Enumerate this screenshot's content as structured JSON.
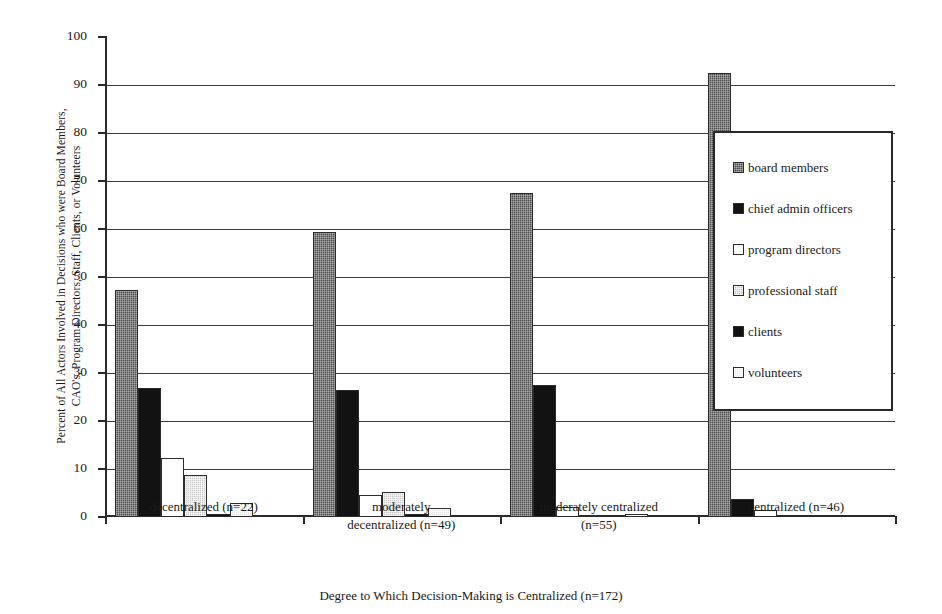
{
  "chart_data": {
    "type": "bar",
    "title": "",
    "xlabel": "Degree to Which Decision-Making is Centralized (n=172)",
    "ylabel": "Percent of All Actors Involved in Decisions who were Board Members,\nCAO's, Program Directors, Staff, Clients, or Volunteers",
    "categories": [
      "decentralized (n=22)",
      "moderately\ndecentralized (n=49)",
      "moderately centralized\n(n=55)",
      "centralized (n=46)"
    ],
    "series": [
      {
        "name": "board members",
        "values": [
          47.3,
          59.4,
          67.5,
          92.5
        ]
      },
      {
        "name": "chief admin officers",
        "values": [
          26.8,
          26.4,
          27.6,
          3.8
        ]
      },
      {
        "name": "program directors",
        "values": [
          12.2,
          4.6,
          2.1,
          1.5
        ]
      },
      {
        "name": "professional staff",
        "values": [
          8.7,
          5.2,
          0.4,
          0.0
        ]
      },
      {
        "name": "clients",
        "values": [
          0.7,
          0.6,
          0.0,
          0.0
        ]
      },
      {
        "name": "volunteers",
        "values": [
          3.0,
          1.9,
          0.6,
          0.0
        ]
      }
    ],
    "ylim": [
      0,
      100
    ],
    "ytick_labels": [
      "0",
      "10",
      "20",
      "30",
      "40",
      "50",
      "60",
      "70",
      "80",
      "90",
      "100"
    ],
    "ytick_values": [
      0,
      10,
      20,
      30,
      40,
      50,
      60,
      70,
      80,
      90,
      100
    ],
    "grid": "horizontal",
    "legend_position": "right-inside",
    "legend_entries": [
      {
        "label": "board members",
        "swatch": "dark-gray-dotted"
      },
      {
        "label": "chief admin officers",
        "swatch": "black-solid"
      },
      {
        "label": "program directors",
        "swatch": "white-outline"
      },
      {
        "label": "professional staff",
        "swatch": "light-gray-dotted"
      },
      {
        "label": "clients",
        "swatch": "black-solid"
      },
      {
        "label": "volunteers",
        "swatch": "white-dotted"
      }
    ]
  }
}
